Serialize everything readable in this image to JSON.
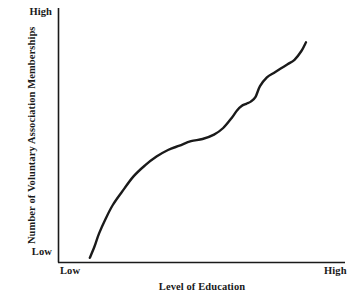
{
  "figure": {
    "background_color": "#ffffff",
    "ink_color": "#1a1a1a"
  },
  "chart_data": {
    "type": "line",
    "title": "",
    "subtitle": "",
    "xlabel": "Level of Education",
    "ylabel": "Number of Voluntary Association Memberships",
    "xlim": [
      0,
      100
    ],
    "ylim": [
      0,
      100
    ],
    "grid": false,
    "legend": null,
    "legend_position": "none",
    "x_tick_labels": [
      "Low",
      "High"
    ],
    "y_tick_labels": [
      "Low",
      "High"
    ],
    "annotations": [],
    "series": [
      {
        "name": "Voluntary association memberships vs. education",
        "line_color": "#1a1a1a",
        "line_width": 2.4,
        "marker": "none",
        "x": [
          6,
          8,
          10,
          13,
          16,
          20,
          25,
          30,
          35,
          40,
          45,
          50,
          55,
          60,
          64,
          68,
          70,
          72,
          74,
          76,
          78,
          80,
          83,
          86,
          89,
          92,
          95,
          98,
          100
        ],
        "y": [
          1,
          6,
          12,
          19,
          25,
          31,
          38,
          43,
          47,
          50,
          52,
          54,
          55,
          57,
          60,
          65,
          68,
          70,
          71,
          72,
          74,
          79,
          83,
          85,
          87,
          89,
          91,
          95,
          99
        ]
      }
    ]
  }
}
